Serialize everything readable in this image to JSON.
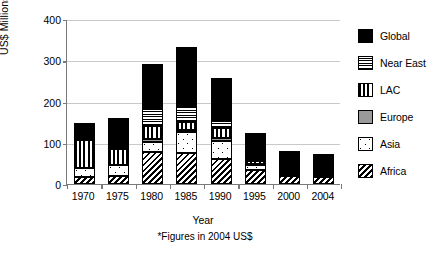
{
  "chart_data": {
    "type": "bar",
    "subtype": "stacked-bar",
    "title": "",
    "xlabel": "Year",
    "ylabel": "US$ Millions*",
    "footnote": "*Figures in 2004 US$",
    "categories": [
      "1970",
      "1975",
      "1980",
      "1985",
      "1990",
      "1995",
      "2000",
      "2004"
    ],
    "ylim": [
      0,
      400
    ],
    "yticks": [
      0,
      100,
      200,
      300,
      400
    ],
    "ytick_labels": [
      "0",
      "100",
      "200",
      "300",
      "400"
    ],
    "grid": true,
    "grid_axis": "y",
    "legend_position": "right",
    "stack_order_bottom_to_top": [
      "Africa",
      "Asia",
      "Europe",
      "LAC",
      "Near East",
      "Global"
    ],
    "series": [
      {
        "name": "Africa",
        "pattern": "diagonal-hatch",
        "values": [
          17,
          19,
          77,
          74,
          61,
          34,
          20,
          17
        ]
      },
      {
        "name": "Asia",
        "pattern": "white-dotted",
        "values": [
          23,
          26,
          26,
          52,
          44,
          12,
          0,
          0
        ]
      },
      {
        "name": "Europe",
        "pattern": "solid-gray",
        "values": [
          0,
          0,
          7,
          5,
          6,
          3,
          0,
          0
        ]
      },
      {
        "name": "LAC",
        "pattern": "vertical-stripes",
        "values": [
          67,
          40,
          31,
          20,
          24,
          6,
          0,
          0
        ]
      },
      {
        "name": "Near East",
        "pattern": "horizontal-stripes",
        "values": [
          0,
          0,
          42,
          37,
          21,
          3,
          0,
          0
        ]
      },
      {
        "name": "Global",
        "pattern": "solid-black",
        "values": [
          41,
          74,
          107,
          144,
          101,
          65,
          60,
          57
        ]
      }
    ],
    "totals": [
      148,
      159,
      290,
      332,
      257,
      123,
      80,
      74
    ],
    "colors": {
      "global": "#000000",
      "europe": "#9a9a9a",
      "axis": "#7a7a7a",
      "grid": "#c9c9c9",
      "background": "#ffffff"
    }
  },
  "legend": {
    "items": [
      {
        "label": "Global",
        "key": "global"
      },
      {
        "label": "Near East",
        "key": "neareast"
      },
      {
        "label": "LAC",
        "key": "lac"
      },
      {
        "label": "Europe",
        "key": "europe"
      },
      {
        "label": "Asia",
        "key": "asia"
      },
      {
        "label": "Africa",
        "key": "africa"
      }
    ]
  }
}
